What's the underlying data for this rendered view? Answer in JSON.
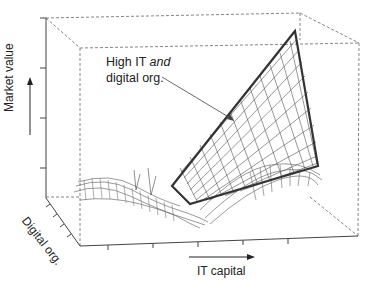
{
  "figure": {
    "annotation": {
      "line1": "High IT ",
      "line1_italic": "and",
      "line2": "digital org."
    },
    "axes": {
      "z_label": "Market value",
      "y_label": "Digital org.",
      "x_label": "IT capital"
    },
    "colors": {
      "mesh": "#555555",
      "highlight": "#333333",
      "box": "#666666",
      "text": "#222222"
    }
  }
}
